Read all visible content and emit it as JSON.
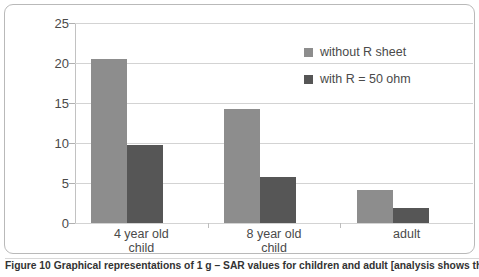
{
  "figure": {
    "caption": "Figure 10 Graphical representations of 1 g – SAR values for children and adult [analysis shows that"
  },
  "legend": {
    "items": [
      {
        "label": "without R sheet",
        "color": "#8d8d8d"
      },
      {
        "label": "with R = 50 ohm",
        "color": "#565656"
      }
    ]
  },
  "colors": {
    "series_a": "#8d8d8d",
    "series_b": "#565656",
    "gridline": "#d3d3d3",
    "frame": "#b9b9b9",
    "text": "#4a4a4a"
  },
  "chart_data": {
    "type": "bar",
    "title": "",
    "xlabel": "",
    "ylabel": "",
    "categories": [
      "4 year old child",
      "8 year old child",
      "adult"
    ],
    "category_lines": [
      [
        "4 year old",
        "child"
      ],
      [
        "8 year old",
        "child"
      ],
      [
        "adult",
        ""
      ]
    ],
    "series": [
      {
        "name": "without R sheet",
        "values": [
          20.5,
          14.2,
          4.1
        ]
      },
      {
        "name": "with R = 50 ohm",
        "values": [
          9.7,
          5.7,
          1.9
        ]
      }
    ],
    "ylim": [
      0,
      25
    ],
    "yticks": [
      0,
      5,
      10,
      15,
      20,
      25
    ],
    "ytick_labels": [
      "0",
      "5",
      "10",
      "15",
      "20",
      "25"
    ],
    "grid": "horizontal",
    "legend_position": "upper right inside"
  }
}
